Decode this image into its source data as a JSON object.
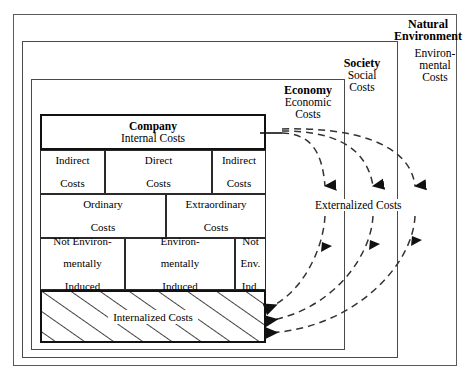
{
  "diagram": {
    "type": "nested-boundary-diagram"
  },
  "boundaries": [
    {
      "id": "natural-environment",
      "name_bold": "Natural",
      "name_bold_2": "Environment",
      "cost_label_line1": "Environ-",
      "cost_label_line2": "mental",
      "cost_label_line3": "Costs"
    },
    {
      "id": "society",
      "name_bold": "Society",
      "cost_label_line1": "Social",
      "cost_label_line2": "Costs"
    },
    {
      "id": "economy",
      "name_bold": "Economy",
      "cost_label_line1": "Economic",
      "cost_label_line2": "Costs"
    },
    {
      "id": "company",
      "name_bold": "Company",
      "cost_label_line1": "Internal Costs"
    }
  ],
  "company": {
    "header_bold": "Company",
    "header_sub": "Internal Costs",
    "rows": [
      {
        "id": "row-direct-indirect",
        "cells": [
          {
            "line1": "Indirect",
            "line2": "Costs"
          },
          {
            "line1": "Direct",
            "line2": "Costs"
          },
          {
            "line1": "Indirect",
            "line2": "Costs"
          }
        ]
      },
      {
        "id": "row-ordinary-extraordinary",
        "cells": [
          {
            "line1": "Ordinary",
            "line2": "Costs"
          },
          {
            "line1": "Extraordinary",
            "line2": "Costs"
          }
        ]
      },
      {
        "id": "row-environmentally-induced",
        "cells": [
          {
            "line1": "Not Environ-",
            "line2": "mentally",
            "line3": "Induced"
          },
          {
            "line1": "Environ-",
            "line2": "mentally",
            "line3": "Induced"
          },
          {
            "line1": "Not",
            "line2": "Env.",
            "line3": "Ind."
          }
        ]
      }
    ],
    "internalized_bar": {
      "label": "Internalized  Costs",
      "fill": "diagonal-hatch"
    }
  },
  "flows": {
    "externalized_label": "Externalized Costs",
    "outbound_count": 3,
    "inbound_count": 3,
    "line_style": "dashed",
    "outbound_description": "Internal costs flow outward from Company into Economy, Society and Natural Environment as Externalized Costs",
    "inbound_description": "Externalized Costs flow back into the Company as Internalized Costs"
  },
  "colors": {
    "ink": "#000000",
    "frame": "#4a4a4a",
    "background": "#ffffff"
  }
}
